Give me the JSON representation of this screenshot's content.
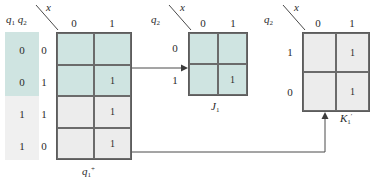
{
  "figure": {
    "type": "karnaugh-map-derivation"
  },
  "colors": {
    "teal_fill": "#cfe4e1",
    "gray_fill": "#ececec",
    "strip_teal": "#cfe4e1",
    "strip_gray": "#f0f0f0",
    "grid_line": "#5c5c5c",
    "connector": "#4a4a4a",
    "text": "#2b2b2b"
  },
  "maps": [
    {
      "id": "q1-next",
      "caption_base": "q",
      "caption_sub": "1",
      "caption_sup": "+",
      "caption_text": "q1+",
      "axis_diagonal_label": "x",
      "row_header_labels": [
        "q",
        "1",
        "q",
        "2"
      ],
      "row_header_text": "q1 q2",
      "column_headers": [
        "0",
        "1"
      ],
      "row_index_left": [
        "0",
        "0",
        "1",
        "1"
      ],
      "row_index_right": [
        "0",
        "1",
        "1",
        "0"
      ],
      "rows": [
        {
          "shade": "teal",
          "cells": [
            "",
            ""
          ]
        },
        {
          "shade": "teal",
          "cells": [
            "",
            "1"
          ]
        },
        {
          "shade": "gray",
          "cells": [
            "",
            "1"
          ]
        },
        {
          "shade": "gray",
          "cells": [
            "",
            "1"
          ]
        }
      ]
    },
    {
      "id": "j1",
      "caption_base": "J",
      "caption_sub": "1",
      "caption_sup": "",
      "caption_text": "J1",
      "axis_diagonal_label": "x",
      "row_header_text": "q2",
      "row_header_base": "q",
      "row_header_sub": "2",
      "column_headers": [
        "0",
        "1"
      ],
      "row_index": [
        "0",
        "1"
      ],
      "rows": [
        {
          "shade": "teal",
          "cells": [
            "",
            ""
          ]
        },
        {
          "shade": "teal",
          "cells": [
            "",
            "1"
          ]
        }
      ]
    },
    {
      "id": "k1-prime",
      "caption_base": "K",
      "caption_sub": "1",
      "caption_sup": "′",
      "caption_text": "K1′",
      "axis_diagonal_label": "x",
      "row_header_text": "q2",
      "row_header_base": "q",
      "row_header_sub": "2",
      "column_headers": [
        "0",
        "1"
      ],
      "row_index": [
        "1",
        "0"
      ],
      "rows": [
        {
          "shade": "gray",
          "cells": [
            "",
            "1"
          ]
        },
        {
          "shade": "gray",
          "cells": [
            "",
            "1"
          ]
        }
      ]
    }
  ],
  "connectors": [
    {
      "id": "arrow-q1next-to-j1",
      "from": "q1-next row 2 (q1=0,q2=1)",
      "to": "j1 row 2 (q2=1)",
      "style": "straight-horizontal-right-arrow"
    },
    {
      "id": "arrow-q1next-to-k1prime",
      "from": "q1-next row 4 (q1=1,q2=0)",
      "to": "k1-prime bottom edge",
      "style": "elbow-down-right-up-arrow"
    }
  ]
}
